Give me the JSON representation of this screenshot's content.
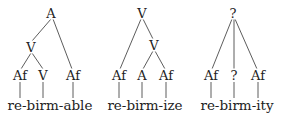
{
  "trees": [
    {
      "root": "A",
      "mid": "V",
      "leaves": [
        "Af",
        "V",
        "Af"
      ],
      "word": "re-birm-able"
    },
    {
      "root": "V",
      "mid": "V",
      "leaves": [
        "Af",
        "A",
        "Af"
      ],
      "word": "re-birm-ize"
    },
    {
      "root": "?",
      "leaves": [
        "Af",
        "?",
        "Af"
      ],
      "word": "re-birm-ity"
    }
  ]
}
